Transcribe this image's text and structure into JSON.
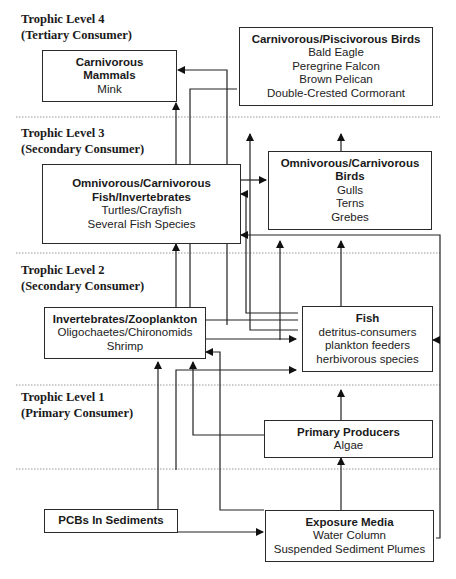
{
  "diagram": {
    "trophic_levels": [
      {
        "id": "level4",
        "title": "Trophic Level 4",
        "subtitle": "(Tertiary Consumer)"
      },
      {
        "id": "level3",
        "title": "Trophic Level 3",
        "subtitle": "(Secondary Consumer)"
      },
      {
        "id": "level2",
        "title": "Trophic Level 2",
        "subtitle": "(Secondary Consumer)"
      },
      {
        "id": "level1",
        "title": "Trophic Level 1",
        "subtitle": "(Primary Consumer)"
      }
    ],
    "nodes": {
      "carnivorous_mammals": {
        "title_lines": [
          "Carnivorous",
          "Mammals"
        ],
        "items": [
          "Mink"
        ]
      },
      "piscivorous_birds": {
        "title_lines": [
          "Carnivorous/Piscivorous Birds"
        ],
        "items": [
          "Bald Eagle",
          "Peregrine Falcon",
          "Brown Pelican",
          "Double-Crested Cormorant"
        ]
      },
      "omnivorous_fish": {
        "title_lines": [
          "Omnivorous/Carnivorous",
          "Fish/Invertebrates"
        ],
        "items": [
          "Turtles/Crayfish",
          "Several Fish Species"
        ]
      },
      "omnivorous_birds": {
        "title_lines": [
          "Omnivorous/Carnivorous",
          "Birds"
        ],
        "items": [
          "Gulls",
          "Terns",
          "Grebes"
        ]
      },
      "invertebrates": {
        "title_lines": [
          "Invertebrates/Zooplankton"
        ],
        "items": [
          "Oligochaetes/Chironomids",
          "Shrimp"
        ]
      },
      "fish": {
        "title_lines": [
          "Fish"
        ],
        "items": [
          "detritus-consumers",
          "plankton feeders",
          "herbivorous species"
        ]
      },
      "primary_producers": {
        "title_lines": [
          "Primary Producers"
        ],
        "items": [
          "Algae"
        ]
      },
      "pcbs_sediments": {
        "title_lines": [
          "PCBs In Sediments"
        ],
        "items": []
      },
      "exposure_media": {
        "title_lines": [
          "Exposure Media"
        ],
        "items": [
          "Water Column",
          "Suspended Sediment Plumes"
        ]
      }
    },
    "edges": [
      {
        "from": "omnivorous_fish",
        "to": "carnivorous_mammals"
      },
      {
        "from": "fish",
        "to": "carnivorous_mammals"
      },
      {
        "from": "omnivorous_fish",
        "to": "omnivorous_birds"
      },
      {
        "from": "fish",
        "to": "piscivorous_birds"
      },
      {
        "from": "omnivorous_birds",
        "to": "piscivorous_birds"
      },
      {
        "from": "invertebrates",
        "to": "omnivorous_fish"
      },
      {
        "from": "fish",
        "to": "omnivorous_fish"
      },
      {
        "from": "exposure_media",
        "to": "omnivorous_fish"
      },
      {
        "from": "fish",
        "to": "omnivorous_birds"
      },
      {
        "from": "invertebrates",
        "to": "fish"
      },
      {
        "from": "pcbs_sediments",
        "to": "fish"
      },
      {
        "from": "exposure_media",
        "to": "fish"
      },
      {
        "from": "primary_producers",
        "to": "fish"
      },
      {
        "from": "pcbs_sediments",
        "to": "invertebrates"
      },
      {
        "from": "primary_producers",
        "to": "invertebrates"
      },
      {
        "from": "exposure_media",
        "to": "invertebrates"
      },
      {
        "from": "exposure_media",
        "to": "primary_producers"
      },
      {
        "from": "pcbs_sediments",
        "to": "exposure_media"
      }
    ]
  }
}
